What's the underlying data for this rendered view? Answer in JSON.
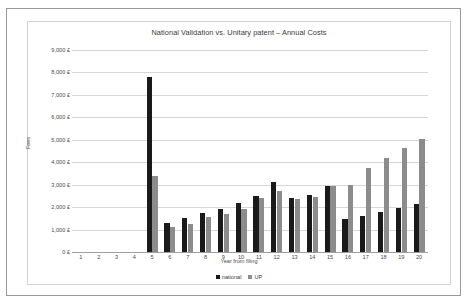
{
  "chart_data": {
    "type": "bar",
    "title": "National Validation vs. Unitary patent – Annual Costs",
    "xlabel": "Year from filing",
    "ylabel": "Fees",
    "ylim": [
      0,
      9000
    ],
    "ytick_step": 1000,
    "grid": true,
    "legend_position": "bottom",
    "categories": [
      "1",
      "2",
      "3",
      "4",
      "5",
      "6",
      "7",
      "8",
      "9",
      "10",
      "11",
      "12",
      "13",
      "14",
      "15",
      "16",
      "17",
      "18",
      "19",
      "20"
    ],
    "ytick_labels": [
      "9,000 £",
      "8,000 £",
      "7,000 £",
      "6,000 £",
      "5,000 £",
      "4,000 £",
      "3,000 £",
      "2,000 £",
      "1,000 £",
      "0 £"
    ],
    "series": [
      {
        "name": "national",
        "color": "#1a1a1a",
        "values": [
          0,
          0,
          0,
          0,
          7800,
          1300,
          1500,
          1750,
          1900,
          2200,
          2500,
          3100,
          2400,
          2550,
          2950,
          1450,
          1600,
          1800,
          1950,
          2150
        ]
      },
      {
        "name": "UP",
        "color": "#8c8c8c",
        "values": [
          0,
          0,
          0,
          0,
          3400,
          1100,
          1250,
          1550,
          1700,
          1900,
          2400,
          2700,
          2350,
          2450,
          2950,
          3000,
          3750,
          4200,
          4650,
          5050
        ]
      }
    ]
  },
  "legend": {
    "items": [
      {
        "label": "national"
      },
      {
        "label": "UP"
      }
    ]
  }
}
